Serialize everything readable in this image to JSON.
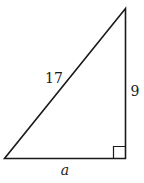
{
  "diagram": {
    "type": "right-triangle",
    "hypotenuse_label": "17",
    "vertical_leg_label": "9",
    "horizontal_leg_label": "a",
    "right_angle_marker": true,
    "stroke_color": "#1a1a1a"
  }
}
